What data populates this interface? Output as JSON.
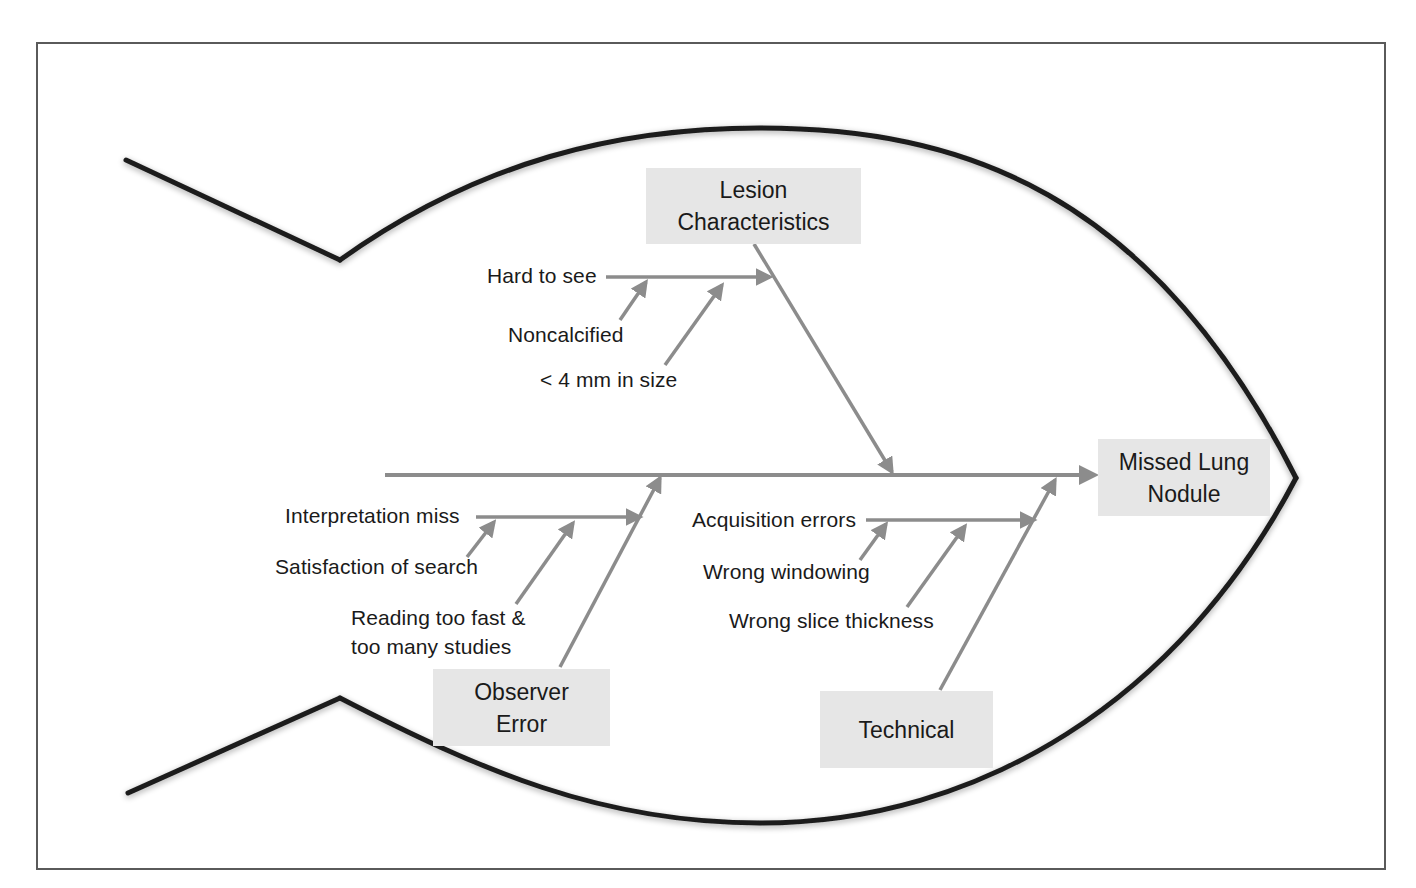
{
  "diagram": {
    "type": "fishbone",
    "effect": {
      "line1": "Missed Lung",
      "line2": "Nodule"
    },
    "categories": [
      {
        "id": "lesion",
        "title_line1": "Lesion",
        "title_line2": "Characteristics",
        "main_cause": "Hard to see",
        "sub_causes": [
          "Noncalcified",
          "< 4 mm in size"
        ]
      },
      {
        "id": "observer",
        "title_line1": "Observer",
        "title_line2": "Error",
        "main_cause": "Interpretation miss",
        "sub_causes": [
          "Satisfaction of search",
          "Reading too fast &",
          "too many studies"
        ]
      },
      {
        "id": "technical",
        "title_line1": "Technical",
        "main_cause": "Acquisition errors",
        "sub_causes": [
          "Wrong windowing",
          "Wrong slice thickness"
        ]
      }
    ],
    "colors": {
      "outline": "#1c1c1c",
      "arrows": "#8c8c8c",
      "box_fill": "#e6e6e6",
      "frame": "#5a5a5a"
    }
  }
}
